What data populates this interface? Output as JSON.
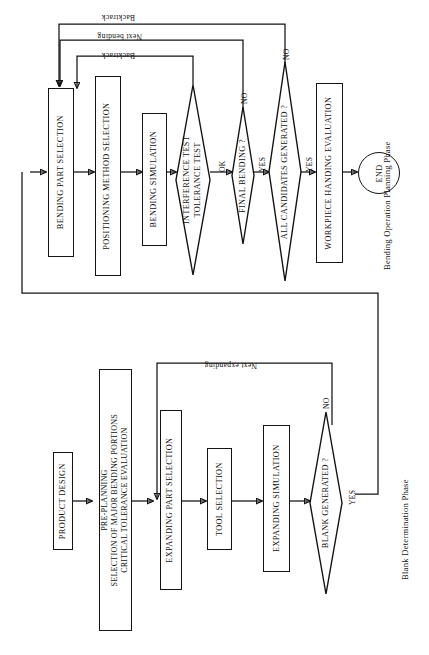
{
  "diagram": {
    "orientation": "rotated-90",
    "phases": [
      {
        "id": "bending",
        "caption": "Bending Operation Planning Phase"
      },
      {
        "id": "blank",
        "caption": "Blank Determination Phase"
      }
    ]
  },
  "bending_phase": {
    "nodes": {
      "bending_part_selection": "BENDING PART SELECTION",
      "positioning_method_selection": "POSITIONING METHOD SELECTION",
      "bending_simulation": "BENDING SIMULATION",
      "interference_test_line1": "INTERFERENCE TEST",
      "interference_test_line2": "TOLERANCE TEST",
      "final_bending": "FINAL BENDING ?",
      "all_candidates": "ALL CANDIDATES GENERATED ?",
      "workpiece_handing": "WORKPIECE HANDING EVALUATION",
      "end": "END"
    },
    "edge_labels": {
      "backtrack_upper": "Backtrack",
      "next_bending": "Next bending",
      "backtrack_lower": "Backtrack",
      "ok": "OK",
      "final_bending_no": "NO",
      "final_bending_yes": "YES",
      "all_candidates_no": "NO",
      "all_candidates_yes": "YES"
    }
  },
  "blank_phase": {
    "nodes": {
      "product_design": "PRODUCT DESIGN",
      "pre_planning_line1": "PRE-PLANNING",
      "pre_planning_line2": "SELECTION OF MAJOR BENDING PORTIONS",
      "pre_planning_line3": "CRITICAL TOLERANCE EVALUATION",
      "expanding_part_selection": "EXPANDING PART SELECTION",
      "tool_selection": "TOOL SELECTION",
      "expanding_simulation": "EXPANDING SIMULATION",
      "blank_generated": "BLANK GENERATED ?"
    },
    "edge_labels": {
      "next_expanding": "Next expanding",
      "blank_generated_no": "NO",
      "blank_generated_yes": "YES"
    }
  },
  "colors": {
    "ink": "#141414",
    "paper": "#ffffff"
  }
}
